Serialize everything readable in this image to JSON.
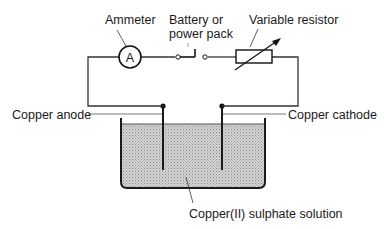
{
  "diagram": {
    "labels": {
      "ammeter": "Ammeter",
      "ammeter_symbol": "A",
      "battery_line1": "Battery or",
      "battery_line2": "power pack",
      "variable_resistor": "Variable resistor",
      "copper_anode": "Copper anode",
      "copper_cathode": "Copper cathode",
      "solution": "Copper(II) sulphate solution"
    },
    "colors": {
      "line": "#1a1a1a",
      "solution_fill": "#c8c8c8",
      "background": "#ffffff"
    }
  }
}
